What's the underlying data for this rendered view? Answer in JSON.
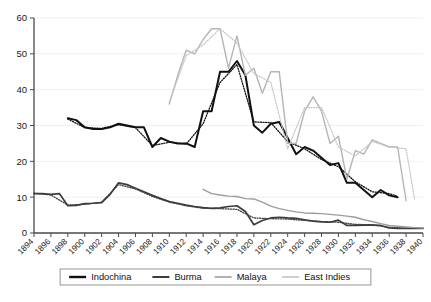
{
  "chart_data": {
    "type": "line",
    "title": "",
    "subtitle": "",
    "xlabel": "",
    "ylabel": "",
    "xlim": [
      1894,
      1940
    ],
    "ylim": [
      0,
      60
    ],
    "grid": true,
    "legend_position": "bottom",
    "yticks": [
      0,
      10,
      20,
      30,
      40,
      50,
      60
    ],
    "xticks": [
      1894,
      1896,
      1898,
      1900,
      1902,
      1904,
      1906,
      1908,
      1910,
      1912,
      1914,
      1916,
      1918,
      1920,
      1922,
      1924,
      1926,
      1928,
      1930,
      1932,
      1934,
      1936,
      1938,
      1940
    ],
    "series": [
      {
        "name": "Indochina",
        "color": "#111111",
        "width": 2.0,
        "style": "solid",
        "x": [
          1898,
          1899,
          1900,
          1901,
          1902,
          1903,
          1904,
          1905,
          1906,
          1907,
          1908,
          1909,
          1910,
          1911,
          1912,
          1913,
          1914,
          1915,
          1916,
          1917,
          1918,
          1919,
          1920,
          1921,
          1922,
          1923,
          1924,
          1925,
          1926,
          1927,
          1928,
          1929,
          1930,
          1931,
          1932,
          1933,
          1934,
          1935,
          1936,
          1937
        ],
        "values": [
          32.0,
          31.5,
          29.5,
          29.0,
          29.0,
          29.5,
          30.5,
          30.0,
          29.5,
          29.5,
          24.0,
          26.5,
          25.5,
          25.0,
          25.0,
          24.0,
          34.0,
          34.0,
          45.0,
          45.0,
          48.0,
          44.0,
          30.0,
          28.0,
          30.5,
          31.0,
          26.5,
          22.0,
          24.0,
          23.0,
          21.0,
          19.0,
          19.5,
          14.0,
          14.0,
          12.0,
          10.0,
          12.0,
          10.5,
          10.0
        ]
      },
      {
        "name": "Indochina-trend",
        "color": "#111111",
        "width": 1.3,
        "style": "dotted",
        "x": [
          1898,
          1900,
          1902,
          1904,
          1906,
          1908,
          1910,
          1912,
          1914,
          1916,
          1918,
          1920,
          1922,
          1924,
          1926,
          1928,
          1930,
          1932,
          1934,
          1936,
          1937
        ],
        "values": [
          31.8,
          29.4,
          29.2,
          30.2,
          29.4,
          24.4,
          25.3,
          24.8,
          30.5,
          42.0,
          47.0,
          31.0,
          30.8,
          25.5,
          23.5,
          20.5,
          18.5,
          14.3,
          11.5,
          11.0,
          10.2
        ]
      },
      {
        "name": "Burma",
        "color": "#3d3d3d",
        "width": 1.7,
        "style": "solid",
        "x": [
          1894,
          1895,
          1896,
          1897,
          1898,
          1899,
          1900,
          1901,
          1902,
          1903,
          1904,
          1905,
          1906,
          1907,
          1908,
          1909,
          1910,
          1911,
          1912,
          1913,
          1914,
          1915,
          1916,
          1917,
          1918,
          1919,
          1920,
          1921,
          1922,
          1923,
          1924,
          1925,
          1926,
          1927,
          1928,
          1929,
          1930,
          1931,
          1932,
          1933,
          1934,
          1935,
          1936,
          1937,
          1938,
          1939,
          1940
        ],
        "values": [
          11.0,
          11.0,
          10.8,
          11.0,
          7.6,
          7.7,
          8.2,
          8.3,
          8.5,
          10.8,
          14.0,
          13.5,
          12.5,
          11.5,
          10.5,
          9.6,
          8.8,
          8.3,
          7.8,
          7.4,
          7.1,
          6.9,
          7.0,
          7.4,
          7.6,
          6.0,
          2.3,
          3.5,
          4.2,
          4.4,
          4.2,
          4.1,
          3.7,
          3.3,
          3.1,
          3.0,
          3.6,
          2.1,
          2.1,
          2.2,
          2.2,
          2.1,
          1.4,
          1.3,
          1.3,
          1.3,
          1.3
        ]
      },
      {
        "name": "Burma-trend",
        "color": "#3d3d3d",
        "width": 1.3,
        "style": "dotted",
        "x": [
          1894,
          1896,
          1898,
          1900,
          1902,
          1904,
          1906,
          1908,
          1910,
          1912,
          1914,
          1916,
          1918,
          1920,
          1922,
          1924,
          1926,
          1928,
          1930,
          1932,
          1934,
          1936,
          1938,
          1940
        ],
        "values": [
          11.1,
          10.6,
          7.8,
          8.0,
          8.6,
          13.5,
          12.3,
          10.2,
          8.6,
          7.6,
          6.9,
          6.8,
          6.6,
          4.2,
          4.0,
          3.9,
          3.5,
          3.2,
          3.0,
          2.4,
          2.3,
          1.6,
          1.3,
          1.3
        ]
      },
      {
        "name": "Malaya",
        "color": "#9c9c9c",
        "width": 1.4,
        "style": "solid",
        "x": [
          1914,
          1915,
          1916,
          1917,
          1918,
          1919,
          1920,
          1921,
          1922,
          1923,
          1924,
          1925,
          1926,
          1927,
          1928,
          1929,
          1930,
          1931,
          1932,
          1933,
          1934,
          1935,
          1936,
          1937,
          1938,
          1939,
          1940
        ],
        "values": [
          12.2,
          11.0,
          10.6,
          10.3,
          10.2,
          9.6,
          9.5,
          8.6,
          7.5,
          6.8,
          6.3,
          5.9,
          5.6,
          5.5,
          5.4,
          5.2,
          5.0,
          4.7,
          4.4,
          3.7,
          3.2,
          2.6,
          2.1,
          1.9,
          1.7,
          1.5,
          1.4
        ]
      },
      {
        "name": "East Indies",
        "color": "#b5b5b5",
        "width": 1.4,
        "style": "solid",
        "x": [
          1910,
          1911,
          1912,
          1913,
          1914,
          1915,
          1916,
          1917,
          1918,
          1919,
          1920,
          1921,
          1922,
          1923,
          1924,
          1925,
          1926,
          1927,
          1928,
          1929,
          1930,
          1931,
          1932,
          1933,
          1934,
          1935,
          1936,
          1937,
          1938
        ],
        "values": [
          36.0,
          44.0,
          51.0,
          50.0,
          54.0,
          57.0,
          57.0,
          46.0,
          55.0,
          44.0,
          46.0,
          39.0,
          45.0,
          45.0,
          25.0,
          25.0,
          34.0,
          38.0,
          34.0,
          25.0,
          27.0,
          15.0,
          23.0,
          22.0,
          26.0,
          25.0,
          24.0,
          24.0,
          9.0
        ]
      },
      {
        "name": "East Indies-trend",
        "color": "#c4c4c4",
        "width": 1.2,
        "style": "dotted",
        "x": [
          1910,
          1912,
          1914,
          1916,
          1918,
          1920,
          1922,
          1924,
          1926,
          1928,
          1930,
          1932,
          1934,
          1936,
          1938,
          1939
        ],
        "values": [
          36.5,
          49.5,
          52.5,
          57.0,
          53.0,
          44.5,
          42.0,
          23.5,
          35.0,
          35.0,
          24.0,
          21.5,
          25.5,
          24.0,
          23.5,
          9.5
        ]
      }
    ],
    "legend": [
      {
        "label": "Indochina",
        "color": "#111111",
        "width": 2.4
      },
      {
        "label": "Burma",
        "color": "#3d3d3d",
        "width": 2.0
      },
      {
        "label": "Malaya",
        "color": "#9c9c9c",
        "width": 1.6
      },
      {
        "label": "East Indies",
        "color": "#c2c2c2",
        "width": 1.6
      }
    ]
  }
}
